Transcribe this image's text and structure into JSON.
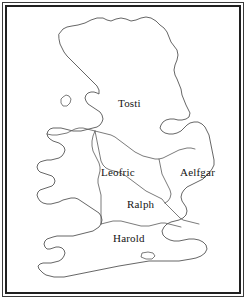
{
  "figure": {
    "type": "outline-map",
    "background_color": "#ffffff",
    "coastline_color": "#4a4a4a",
    "boundary_color": "#595959",
    "label_color": "#141414",
    "frame": {
      "style": "double-rule",
      "outer_rule_color": "#3b3b3b",
      "inner_rule_color": "#202020"
    }
  },
  "labels": {
    "tosti": "Tosti",
    "leofric": "Leofric",
    "aelfgar": "Aelfgar",
    "ralph": "Ralph",
    "harold": "Harold"
  },
  "regions": [
    {
      "name": "Tosti",
      "position": "north",
      "label": "Tosti"
    },
    {
      "name": "Leofric",
      "position": "midlands",
      "label": "Leofric"
    },
    {
      "name": "Aelfgar",
      "position": "east-anglia",
      "label": "Aelfgar"
    },
    {
      "name": "Ralph",
      "position": "south-midlands",
      "label": "Ralph"
    },
    {
      "name": "Harold",
      "position": "south",
      "label": "Harold"
    }
  ],
  "islands": [
    {
      "name": "Isle of Man",
      "position": "irish-sea"
    },
    {
      "name": "Isle of Wight",
      "position": "south-coast"
    }
  ]
}
